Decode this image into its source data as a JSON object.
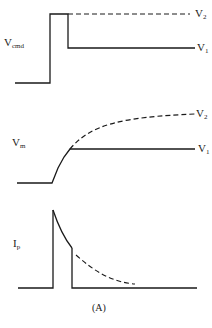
{
  "figure": {
    "caption": "(A)",
    "panels": [
      {
        "id": "vcmd",
        "label_main": "V",
        "label_sub": "cmd",
        "traces": [
          {
            "name": "V1",
            "style": "solid",
            "label_main": "V",
            "label_sub": "1"
          },
          {
            "name": "V2",
            "style": "dashed",
            "label_main": "V",
            "label_sub": "2"
          }
        ]
      },
      {
        "id": "vm",
        "label_main": "V",
        "label_sub": "m",
        "traces": [
          {
            "name": "V1",
            "style": "solid",
            "label_main": "V",
            "label_sub": "1"
          },
          {
            "name": "V2",
            "style": "dashed",
            "label_main": "V",
            "label_sub": "2"
          }
        ]
      },
      {
        "id": "ip",
        "label_main": "I",
        "label_sub": "p",
        "traces": [
          {
            "name": "brief pulse",
            "style": "solid"
          },
          {
            "name": "sustained decay",
            "style": "dashed"
          }
        ]
      }
    ]
  },
  "colors": {
    "line": "#1a1a1a",
    "background": "#ffffff"
  }
}
